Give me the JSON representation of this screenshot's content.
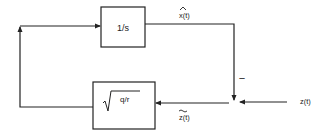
{
  "diagram": {
    "type": "block-diagram",
    "blocks": {
      "integrator": {
        "label": "1/s"
      },
      "gain": {
        "label": "q/r",
        "prefix": "sqrt"
      }
    },
    "signals": {
      "estimate": {
        "label": "x(t)",
        "accent": "hat"
      },
      "innovation": {
        "label": "z(t)",
        "accent": "tilde"
      },
      "measurement": {
        "label": "z(t)"
      }
    },
    "summing_junction": {
      "sign": "−"
    },
    "colors": {
      "line": "#222222",
      "background": "#ffffff"
    }
  }
}
